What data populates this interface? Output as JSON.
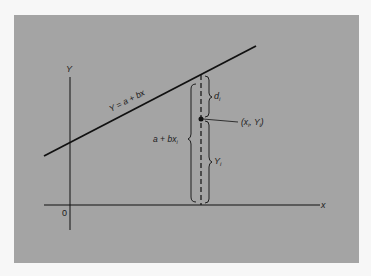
{
  "diagram": {
    "type": "regression-deviation-diagram",
    "background_color": "#a4a4a4",
    "line_color": "#111111",
    "axes": {
      "x_label": "x",
      "y_label": "Y",
      "origin_label": "0"
    },
    "regression_line": {
      "label": "Y = a + bx"
    },
    "point": {
      "label_main": "(x",
      "label_sub1": "i",
      "label_mid": ", Y",
      "label_sub2": "i",
      "label_end": ")"
    },
    "braces": {
      "deviation": {
        "label": "d",
        "sub": "i"
      },
      "fitted_value": {
        "label": "a + bx",
        "sub": "i"
      },
      "observed_value": {
        "label": "Y",
        "sub": "i"
      }
    }
  }
}
